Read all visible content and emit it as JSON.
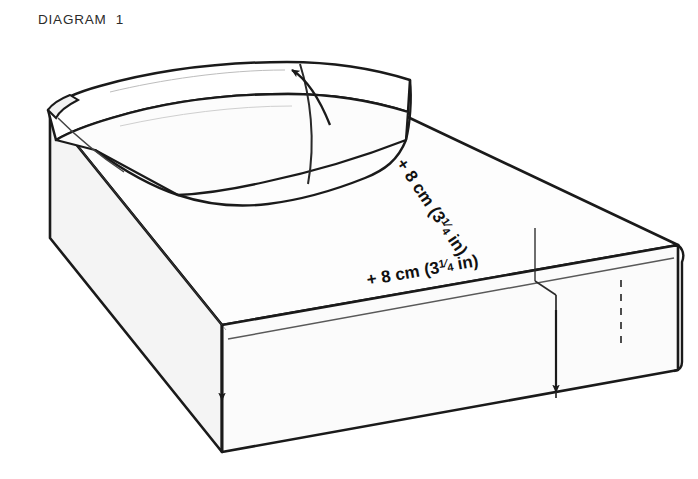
{
  "page": {
    "width": 698,
    "height": 479,
    "background": "#ffffff"
  },
  "header": {
    "title": "DIAGRAM  1"
  },
  "diagram": {
    "colors": {
      "outline": "#1a1a1a",
      "fill_top": "#fdfdfd",
      "fill_side": "#f7f7f7",
      "fill_front": "#fbfbfb",
      "fill_quilt": "#fefefe",
      "dashed": "#3a3a3a",
      "text": "#111111"
    },
    "measurements": [
      {
        "name": "length-allowance",
        "prefix": "+",
        "value": "8",
        "unit": "cm",
        "imperial_whole": "3",
        "imperial_num": "1",
        "imperial_den": "4",
        "imperial_unit": "in",
        "full_text": "+ 8 cm (3 1/4 in)",
        "orientation": "along-right-long-edge"
      },
      {
        "name": "width-allowance",
        "prefix": "+",
        "value": "8",
        "unit": "cm",
        "imperial_whole": "3",
        "imperial_num": "1",
        "imperial_den": "4",
        "imperial_unit": "in",
        "full_text": "+ 8 cm (3 1/4 in)",
        "orientation": "along-front-top-edge"
      }
    ],
    "arrows": [
      {
        "name": "quilt-direction-arrow",
        "direction": "up-left"
      },
      {
        "name": "depth-arrow-left",
        "direction": "down"
      },
      {
        "name": "depth-arrow-right",
        "direction": "down"
      }
    ],
    "dashed_lines": [
      {
        "name": "corner-depth-guide",
        "style": "dashed-vertical"
      }
    ]
  }
}
